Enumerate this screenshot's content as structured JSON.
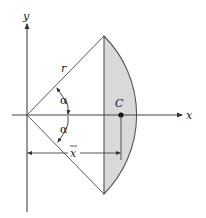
{
  "figure": {
    "axis_labels": {
      "x": "x",
      "y": "y"
    },
    "radius_label": "r",
    "angle_label_upper": "α",
    "angle_label_lower": "α",
    "centroid_label": "C",
    "distance_label": "x",
    "colors": {
      "line": "#444444",
      "shade": "#d9d9d9",
      "background": "#ffffff"
    }
  }
}
